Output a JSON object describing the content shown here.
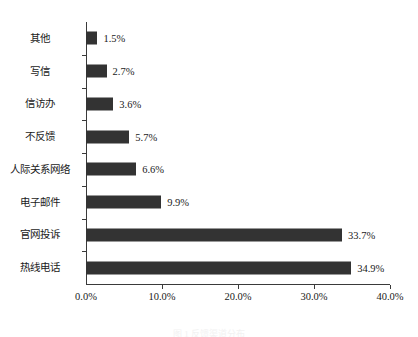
{
  "chart_data": {
    "type": "bar",
    "orientation": "horizontal",
    "title": "",
    "xlabel": "",
    "ylabel": "",
    "xlim": [
      0,
      40
    ],
    "xticks": [
      "0.0%",
      "10.0%",
      "20.0%",
      "30.0%",
      "40.0%"
    ],
    "xtick_values": [
      0,
      10,
      20,
      30,
      40
    ],
    "grid": false,
    "legend": false,
    "bar_color": "#333333",
    "axis_color": "#3a3a3a",
    "categories": [
      "其他",
      "写信",
      "信访办",
      "不反馈",
      "人际关系网络",
      "电子邮件",
      "官网投诉",
      "热线电话"
    ],
    "values": [
      1.5,
      2.7,
      3.6,
      5.7,
      6.6,
      9.9,
      33.7,
      34.9
    ],
    "value_labels": [
      "1.5%",
      "2.7%",
      "3.6%",
      "5.7%",
      "6.6%",
      "9.9%",
      "33.7%",
      "34.9%"
    ]
  },
  "caption": {
    "text": "图 1 反馈渠道分布"
  }
}
